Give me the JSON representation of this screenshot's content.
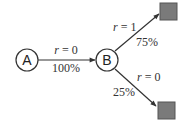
{
  "diagram": {
    "type": "state-transition",
    "nodes": [
      {
        "id": "A",
        "label": "A",
        "shape": "circle"
      },
      {
        "id": "B",
        "label": "B",
        "shape": "circle"
      },
      {
        "id": "T1",
        "label": "",
        "shape": "square",
        "color": "#7a7a7a"
      },
      {
        "id": "T2",
        "label": "",
        "shape": "square",
        "color": "#7a7a7a"
      }
    ],
    "edges": [
      {
        "from": "A",
        "to": "B",
        "reward_var": "r",
        "reward_eq": " = 0",
        "probability": "100%"
      },
      {
        "from": "B",
        "to": "T1",
        "reward_var": "r",
        "reward_eq": " = 1",
        "probability": "75%"
      },
      {
        "from": "B",
        "to": "T2",
        "reward_var": "r",
        "reward_eq": " = 0",
        "probability": "25%"
      }
    ]
  },
  "colors": {
    "stroke": "#333333",
    "terminal_fill": "#7a7a7a",
    "background": "#ffffff"
  }
}
